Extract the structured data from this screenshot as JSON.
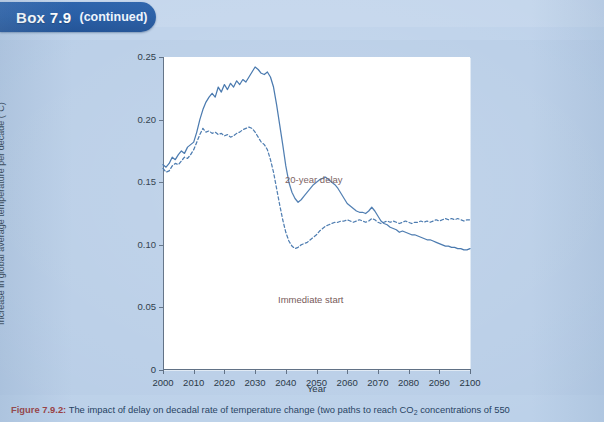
{
  "box_header": {
    "title": "Box 7.9",
    "continued": "(continued)"
  },
  "colors": {
    "page_background": "#b9cee7",
    "tab_blue": "#245ba4",
    "series_line": "#3a6ea8",
    "annotation_text": "#6b4b4b",
    "caption_number": "#9a3b3b",
    "plot_background": "#ffffff",
    "axis": "#5a6b80"
  },
  "figure": {
    "caption_number": "Figure 7.9.2:",
    "caption_text_1": "The impact of delay on decadal rate of temperature change (two paths to reach CO",
    "caption_sub": "2",
    "caption_text_2": " concentrations of 550"
  },
  "chart_data": {
    "type": "line",
    "title": "",
    "xlabel": "Year",
    "ylabel": "Increase in global average temperature per decade (°C)",
    "xlim": [
      2000,
      2100
    ],
    "ylim": [
      0,
      0.25
    ],
    "xticks": [
      2000,
      2010,
      2020,
      2030,
      2040,
      2050,
      2060,
      2070,
      2080,
      2090,
      2100
    ],
    "xtick_labels": [
      "2000",
      "2010",
      "2020",
      "2030",
      "2040",
      "2050",
      "2060",
      "2070",
      "2080",
      "2090",
      "2100"
    ],
    "yticks": [
      0,
      0.05,
      0.1,
      0.15,
      0.2,
      0.25
    ],
    "ytick_labels": [
      "0",
      "0.05",
      "0.10",
      "0.15",
      "0.20",
      "0.25"
    ],
    "grid": false,
    "legend_position": "inline-annotations",
    "series": [
      {
        "name": "20-year delay",
        "style": "solid",
        "color": "#3a6ea8",
        "annotation": "20-year delay",
        "x": [
          2000,
          2001,
          2002,
          2003,
          2004,
          2005,
          2006,
          2007,
          2008,
          2009,
          2010,
          2011,
          2012,
          2013,
          2014,
          2015,
          2016,
          2017,
          2018,
          2019,
          2020,
          2021,
          2022,
          2023,
          2024,
          2025,
          2026,
          2027,
          2028,
          2029,
          2030,
          2031,
          2032,
          2033,
          2034,
          2035,
          2036,
          2037,
          2038,
          2039,
          2040,
          2041,
          2042,
          2043,
          2044,
          2045,
          2046,
          2047,
          2048,
          2049,
          2050,
          2051,
          2052,
          2053,
          2054,
          2055,
          2056,
          2057,
          2058,
          2059,
          2060,
          2061,
          2062,
          2063,
          2064,
          2065,
          2066,
          2067,
          2068,
          2069,
          2070,
          2071,
          2072,
          2073,
          2074,
          2075,
          2076,
          2077,
          2078,
          2079,
          2080,
          2081,
          2082,
          2083,
          2084,
          2085,
          2086,
          2087,
          2088,
          2089,
          2090,
          2091,
          2092,
          2093,
          2094,
          2095,
          2096,
          2097,
          2098,
          2099,
          2100
        ],
        "y": [
          0.164,
          0.162,
          0.165,
          0.17,
          0.168,
          0.172,
          0.175,
          0.173,
          0.178,
          0.18,
          0.182,
          0.19,
          0.2,
          0.208,
          0.214,
          0.218,
          0.221,
          0.218,
          0.226,
          0.222,
          0.228,
          0.224,
          0.229,
          0.226,
          0.231,
          0.228,
          0.232,
          0.23,
          0.234,
          0.238,
          0.242,
          0.24,
          0.237,
          0.236,
          0.238,
          0.234,
          0.226,
          0.212,
          0.196,
          0.18,
          0.163,
          0.15,
          0.142,
          0.137,
          0.134,
          0.136,
          0.139,
          0.142,
          0.145,
          0.148,
          0.15,
          0.152,
          0.153,
          0.154,
          0.152,
          0.15,
          0.148,
          0.145,
          0.141,
          0.137,
          0.133,
          0.131,
          0.129,
          0.127,
          0.126,
          0.126,
          0.125,
          0.127,
          0.13,
          0.127,
          0.123,
          0.119,
          0.117,
          0.116,
          0.114,
          0.113,
          0.112,
          0.11,
          0.111,
          0.11,
          0.109,
          0.108,
          0.108,
          0.107,
          0.106,
          0.105,
          0.104,
          0.104,
          0.103,
          0.102,
          0.101,
          0.1,
          0.099,
          0.099,
          0.098,
          0.098,
          0.097,
          0.097,
          0.096,
          0.096,
          0.097
        ]
      },
      {
        "name": "Immediate start",
        "style": "dashed",
        "color": "#3a6ea8",
        "annotation": "Immediate start",
        "x": [
          2000,
          2001,
          2002,
          2003,
          2004,
          2005,
          2006,
          2007,
          2008,
          2009,
          2010,
          2011,
          2012,
          2013,
          2014,
          2015,
          2016,
          2017,
          2018,
          2019,
          2020,
          2021,
          2022,
          2023,
          2024,
          2025,
          2026,
          2027,
          2028,
          2029,
          2030,
          2031,
          2032,
          2033,
          2034,
          2035,
          2036,
          2037,
          2038,
          2039,
          2040,
          2041,
          2042,
          2043,
          2044,
          2045,
          2046,
          2047,
          2048,
          2049,
          2050,
          2051,
          2052,
          2053,
          2054,
          2055,
          2056,
          2057,
          2058,
          2059,
          2060,
          2061,
          2062,
          2063,
          2064,
          2065,
          2066,
          2067,
          2068,
          2069,
          2070,
          2071,
          2072,
          2073,
          2074,
          2075,
          2076,
          2077,
          2078,
          2079,
          2080,
          2081,
          2082,
          2083,
          2084,
          2085,
          2086,
          2087,
          2088,
          2089,
          2090,
          2091,
          2092,
          2093,
          2094,
          2095,
          2096,
          2097,
          2098,
          2099,
          2100
        ],
        "y": [
          0.161,
          0.158,
          0.159,
          0.163,
          0.165,
          0.164,
          0.167,
          0.17,
          0.169,
          0.172,
          0.176,
          0.182,
          0.188,
          0.193,
          0.19,
          0.191,
          0.189,
          0.19,
          0.188,
          0.189,
          0.187,
          0.188,
          0.186,
          0.187,
          0.189,
          0.19,
          0.192,
          0.193,
          0.194,
          0.193,
          0.19,
          0.186,
          0.182,
          0.18,
          0.176,
          0.168,
          0.158,
          0.145,
          0.132,
          0.12,
          0.11,
          0.103,
          0.099,
          0.097,
          0.098,
          0.1,
          0.101,
          0.102,
          0.104,
          0.106,
          0.108,
          0.111,
          0.113,
          0.115,
          0.116,
          0.117,
          0.118,
          0.118,
          0.119,
          0.119,
          0.12,
          0.119,
          0.118,
          0.119,
          0.12,
          0.119,
          0.118,
          0.119,
          0.121,
          0.12,
          0.118,
          0.117,
          0.118,
          0.119,
          0.118,
          0.119,
          0.118,
          0.117,
          0.118,
          0.119,
          0.118,
          0.117,
          0.118,
          0.118,
          0.119,
          0.118,
          0.119,
          0.118,
          0.119,
          0.12,
          0.119,
          0.12,
          0.121,
          0.12,
          0.121,
          0.12,
          0.121,
          0.12,
          0.119,
          0.12,
          0.12
        ]
      }
    ]
  }
}
